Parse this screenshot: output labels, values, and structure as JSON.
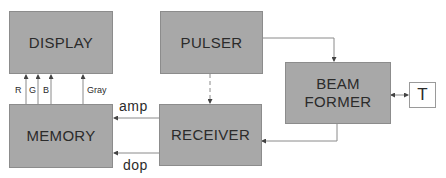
{
  "blocks": {
    "display": {
      "label": "DISPLAY"
    },
    "pulser": {
      "label": "PULSER"
    },
    "beam_former": {
      "line1": "BEAM",
      "line2": "FORMER"
    },
    "transducer": {
      "label": "T"
    },
    "memory": {
      "label": "MEMORY"
    },
    "receiver": {
      "label": "RECEIVER"
    }
  },
  "signals": {
    "r": "R",
    "g": "G",
    "b": "B",
    "gray": "Gray",
    "amp": "amp",
    "dop": "dop"
  },
  "colors": {
    "box_fill": "#a8a8a8",
    "line": "#7a7a7a",
    "text": "#2b2b2b"
  }
}
